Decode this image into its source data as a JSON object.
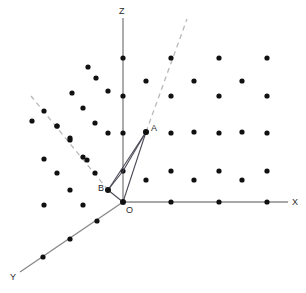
{
  "figure": {
    "background_color": "#ffffff",
    "dot_color": "#111111",
    "axis_color": "#8a8a8a",
    "vector_color": "#4a4a57",
    "dashed_color": "#b9b9b9",
    "label_color": "#2b2b2b",
    "dot_radius": 2.6,
    "width": 306,
    "height": 293
  },
  "axes": {
    "origin": {
      "x": 123,
      "y": 202,
      "label": "O",
      "label_x": 126,
      "label_y": 213
    },
    "items": [
      {
        "name": "z-axis",
        "label": "Z",
        "x1": 123,
        "y1": 202,
        "x2": 123,
        "y2": 18,
        "label_x": 119,
        "label_y": 14
      },
      {
        "name": "x-axis",
        "label": "X",
        "x1": 123,
        "y1": 202,
        "x2": 288,
        "y2": 202,
        "label_x": 292,
        "label_y": 205
      },
      {
        "name": "y-axis",
        "label": "Y",
        "x1": 123,
        "y1": 202,
        "x2": 20,
        "y2": 272,
        "label_x": 10,
        "label_y": 280
      }
    ],
    "axis_ticks": {
      "z": [
        {
          "x": 123,
          "y": 58
        },
        {
          "x": 123,
          "y": 96
        },
        {
          "x": 123,
          "y": 133
        },
        {
          "x": 123,
          "y": 171
        }
      ],
      "x": [
        {
          "x": 171,
          "y": 202
        },
        {
          "x": 219,
          "y": 202
        },
        {
          "x": 267,
          "y": 202
        }
      ],
      "y": [
        {
          "x": 97,
          "y": 221
        },
        {
          "x": 70,
          "y": 239
        },
        {
          "x": 43,
          "y": 257
        }
      ]
    }
  },
  "points": [
    {
      "name": "point-a",
      "label": "A",
      "x": 146,
      "y": 132,
      "label_x": 151,
      "label_y": 131
    },
    {
      "name": "point-b",
      "label": "B",
      "x": 108,
      "y": 190,
      "label_x": 98,
      "label_y": 191
    }
  ],
  "vectors": [
    {
      "name": "vector-oa",
      "x1": 123,
      "y1": 202,
      "x2": 146,
      "y2": 132
    },
    {
      "name": "vector-ob",
      "x1": 123,
      "y1": 202,
      "x2": 108,
      "y2": 190
    },
    {
      "name": "segment-ba",
      "x1": 108,
      "y1": 190,
      "x2": 146,
      "y2": 132
    },
    {
      "name": "segment-b-zaxis-a",
      "x1": 108,
      "y1": 190,
      "x2": 123,
      "y2": 171
    },
    {
      "name": "segment-zaxis-a",
      "x1": 123,
      "y1": 171,
      "x2": 146,
      "y2": 132
    }
  ],
  "dashed_lines": [
    {
      "name": "dashed-line-right",
      "x1": 146,
      "y1": 132,
      "x2": 187,
      "y2": 19
    },
    {
      "name": "dashed-line-left",
      "x1": 108,
      "y1": 190,
      "x2": 31,
      "y2": 96
    }
  ],
  "lattice_dots": {
    "right_quadrant_primary": [
      {
        "x": 171,
        "y": 58
      },
      {
        "x": 219,
        "y": 58
      },
      {
        "x": 267,
        "y": 58
      },
      {
        "x": 171,
        "y": 96
      },
      {
        "x": 219,
        "y": 96
      },
      {
        "x": 267,
        "y": 96
      },
      {
        "x": 171,
        "y": 133
      },
      {
        "x": 219,
        "y": 133
      },
      {
        "x": 267,
        "y": 133
      },
      {
        "x": 171,
        "y": 171
      },
      {
        "x": 219,
        "y": 171
      },
      {
        "x": 267,
        "y": 171
      }
    ],
    "right_quadrant_interstitial": [
      {
        "x": 146,
        "y": 81
      },
      {
        "x": 194,
        "y": 81
      },
      {
        "x": 242,
        "y": 81
      },
      {
        "x": 146,
        "y": 132
      },
      {
        "x": 194,
        "y": 132
      },
      {
        "x": 242,
        "y": 132
      },
      {
        "x": 146,
        "y": 180
      },
      {
        "x": 194,
        "y": 180
      },
      {
        "x": 242,
        "y": 180
      }
    ],
    "left_quadrant": [
      {
        "x": 88,
        "y": 67
      },
      {
        "x": 96,
        "y": 78
      },
      {
        "x": 72,
        "y": 93
      },
      {
        "x": 108,
        "y": 91
      },
      {
        "x": 83,
        "y": 108
      },
      {
        "x": 95,
        "y": 123
      },
      {
        "x": 108,
        "y": 133
      },
      {
        "x": 70,
        "y": 138
      },
      {
        "x": 44,
        "y": 159
      },
      {
        "x": 87,
        "y": 160
      },
      {
        "x": 57,
        "y": 173
      },
      {
        "x": 70,
        "y": 190
      },
      {
        "x": 44,
        "y": 205
      },
      {
        "x": 83,
        "y": 205
      },
      {
        "x": 32,
        "y": 121
      },
      {
        "x": 57,
        "y": 126
      }
    ],
    "dashed_line_dots_left": [
      {
        "x": 44,
        "y": 111
      },
      {
        "x": 57,
        "y": 126
      },
      {
        "x": 70,
        "y": 140
      },
      {
        "x": 83,
        "y": 157
      },
      {
        "x": 95,
        "y": 173
      }
    ]
  }
}
